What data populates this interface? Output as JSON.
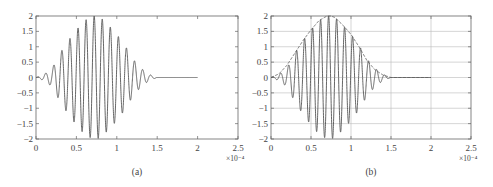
{
  "chart_data": [
    {
      "id": "a",
      "type": "line",
      "caption": "(a)",
      "title": "",
      "xlabel": "",
      "ylabel": "",
      "x_multiplier_label": "×10⁻⁴",
      "xlim": [
        0,
        2.5
      ],
      "ylim": [
        -2,
        2
      ],
      "x_ticks": [
        "0",
        "0.5",
        "1",
        "1.5",
        "2",
        "2.5"
      ],
      "y_ticks": [
        "2",
        "1.5",
        "1",
        "0.5",
        "0",
        "-0.5",
        "-1",
        "-1.5",
        "-2"
      ],
      "grid": false,
      "series": [
        {
          "name": "Gaussian-modulated sinusoid",
          "description": "Signal of amplitude 2 with Gaussian envelope centered at 0.75e-4, carrier ≈ 10 cycles per 1e-4 s, active from 0 to 1.5e-4, zero from 1.5e-4 to 2e-4",
          "x": [
            0,
            0.1,
            0.2,
            0.3,
            0.4,
            0.5,
            0.6,
            0.7,
            0.75,
            0.8,
            0.9,
            1.0,
            1.1,
            1.2,
            1.3,
            1.4,
            1.5,
            2.0
          ],
          "envelope": [
            0.0,
            0.1,
            0.3,
            0.8,
            1.2,
            1.55,
            1.85,
            2.0,
            2.0,
            1.95,
            1.7,
            1.4,
            1.05,
            0.6,
            0.3,
            0.1,
            0.0,
            0.0
          ]
        }
      ]
    },
    {
      "id": "b",
      "type": "line",
      "caption": "(b)",
      "title": "",
      "xlabel": "",
      "ylabel": "",
      "x_multiplier_label": "×10⁻⁴",
      "xlim": [
        0,
        2.5
      ],
      "ylim": [
        -2,
        2
      ],
      "x_ticks": [
        "0",
        "0.5",
        "1",
        "1.5",
        "2",
        "2.5"
      ],
      "y_ticks": [
        "2",
        "1.5",
        "1",
        "0.5",
        "0",
        "-0.5",
        "-1",
        "-1.5",
        "-2"
      ],
      "grid": true,
      "series": [
        {
          "name": "Gaussian-modulated sinusoid",
          "description": "Same signal as (a)",
          "x": [
            0,
            0.1,
            0.2,
            0.3,
            0.4,
            0.5,
            0.6,
            0.7,
            0.75,
            0.8,
            0.9,
            1.0,
            1.1,
            1.2,
            1.3,
            1.4,
            1.5,
            2.0
          ],
          "envelope": [
            0.0,
            0.1,
            0.3,
            0.8,
            1.2,
            1.55,
            1.85,
            2.0,
            2.0,
            1.95,
            1.7,
            1.4,
            1.05,
            0.6,
            0.3,
            0.1,
            0.0,
            0.0
          ]
        },
        {
          "name": "Envelope",
          "style": "dashed",
          "x": [
            0,
            0.1,
            0.2,
            0.3,
            0.4,
            0.5,
            0.6,
            0.7,
            0.75,
            0.8,
            0.9,
            1.0,
            1.1,
            1.2,
            1.3,
            1.4,
            1.5,
            2.0
          ],
          "values": [
            0.0,
            0.12,
            0.4,
            0.8,
            1.2,
            1.55,
            1.85,
            2.0,
            2.0,
            1.95,
            1.7,
            1.4,
            1.0,
            0.55,
            0.25,
            0.08,
            0.0,
            0.0
          ]
        }
      ]
    }
  ],
  "style": {
    "line_color": "#555555",
    "axis_color": "#666666",
    "grid_color": "#bbbbbb",
    "background": "#ffffff"
  }
}
